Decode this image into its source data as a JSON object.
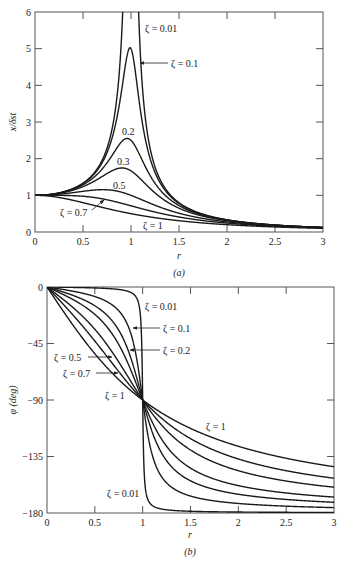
{
  "chart_data": [
    {
      "type": "line",
      "panel": "(a)",
      "title": "",
      "xlabel": "r",
      "ylabel": "x/δst",
      "xlim": [
        0,
        3
      ],
      "ylim": [
        0,
        6
      ],
      "xticks": [
        0,
        0.5,
        1,
        1.5,
        2,
        2.5,
        3
      ],
      "xtick_labels": [
        "0",
        "0.5",
        "1",
        "1.5",
        "2",
        "2.5",
        "3"
      ],
      "yticks": [
        0,
        1,
        2,
        3,
        4,
        5,
        6
      ],
      "ytick_labels": [
        "0",
        "1",
        "2",
        "3",
        "4",
        "5",
        "6"
      ],
      "grid": false,
      "legend": "none (inline annotations)",
      "formula": "x/δst = 1/sqrt((1-r^2)^2 + (2ζr)^2)",
      "series": [
        {
          "name": "ζ = 0.01",
          "zeta": 0.01,
          "peak_value": 50.0,
          "peak_r": 1.0
        },
        {
          "name": "ζ = 0.1",
          "zeta": 0.1,
          "peak_value": 5.03,
          "peak_r": 0.99
        },
        {
          "name": "0.2",
          "zeta": 0.2,
          "peak_value": 2.55,
          "peak_r": 0.96
        },
        {
          "name": "0.3",
          "zeta": 0.3,
          "peak_value": 1.75,
          "peak_r": 0.91
        },
        {
          "name": "0.5",
          "zeta": 0.5,
          "peak_value": 1.15,
          "peak_r": 0.71
        },
        {
          "name": "ζ = 0.7",
          "zeta": 0.7,
          "peak_value": 1.0,
          "peak_r": 0.0
        },
        {
          "name": "ζ = 1",
          "zeta": 1.0,
          "peak_value": 1.0,
          "peak_r": 0.0
        }
      ],
      "sample_points": {
        "r": [
          0,
          0.5,
          1,
          1.5,
          2,
          2.5,
          3
        ],
        "zeta_0.1": [
          1.0,
          1.32,
          5.0,
          0.78,
          0.33,
          0.19,
          0.12
        ],
        "zeta_0.5": [
          1.0,
          1.11,
          1.0,
          0.57,
          0.3,
          0.18,
          0.12
        ],
        "zeta_1": [
          1.0,
          0.8,
          0.5,
          0.31,
          0.2,
          0.14,
          0.1
        ]
      },
      "annotations": [
        "ζ = 0.01",
        "ζ = 0.1",
        "0.2",
        "0.3",
        "0.5",
        "ζ = 0.7",
        "ζ = 1"
      ]
    },
    {
      "type": "line",
      "panel": "(b)",
      "title": "",
      "xlabel": "r",
      "ylabel": "φ (deg)",
      "xlim": [
        0,
        3
      ],
      "ylim": [
        -180,
        0
      ],
      "xticks": [
        0,
        0.5,
        1,
        1.5,
        2,
        2.5,
        3
      ],
      "xtick_labels": [
        "0",
        "0.5",
        "1",
        "1.5",
        "2",
        "2.5",
        "3"
      ],
      "yticks": [
        0,
        -45,
        -90,
        -135,
        -180
      ],
      "ytick_labels": [
        "0",
        "−45",
        "−90",
        "−135",
        "−180"
      ],
      "grid": false,
      "legend": "none (inline annotations)",
      "formula": "φ = −atan2(2ζr, 1 − r^2)",
      "series": [
        {
          "name": "ζ = 0.01",
          "zeta": 0.01
        },
        {
          "name": "ζ = 0.1",
          "zeta": 0.1
        },
        {
          "name": "ζ = 0.2",
          "zeta": 0.2
        },
        {
          "name": "ζ = 0.3",
          "zeta": 0.3
        },
        {
          "name": "ζ = 0.5",
          "zeta": 0.5
        },
        {
          "name": "ζ = 0.7",
          "zeta": 0.7
        },
        {
          "name": "ζ = 1",
          "zeta": 1.0
        }
      ],
      "sample_points": {
        "r": [
          0,
          0.5,
          1,
          1.5,
          2,
          2.5,
          3
        ],
        "zeta_1": [
          0,
          -53.1,
          -90,
          -112.6,
          -126.9,
          -136.4,
          -143.1
        ],
        "zeta_0.1": [
          0,
          -7.6,
          -90,
          -166.5,
          -172.4,
          -174.6,
          -175.7
        ]
      },
      "annotations": [
        "ζ = 0.01",
        "ζ = 0.1",
        "ζ = 0.2",
        "ζ = 0.5",
        "ζ = 0.7",
        "ζ = 1",
        "ζ = 1",
        "ζ = 0.01"
      ]
    }
  ],
  "panel_a": {
    "caption": "(a)",
    "xlabel": "r",
    "ylabel": "x/δst",
    "labels": {
      "z001": "ζ = 0.01",
      "z01": "ζ = 0.1",
      "z02": "0.2",
      "z03": "0.3",
      "z05": "0.5",
      "z07": "ζ = 0.7",
      "z1": "ζ = 1"
    }
  },
  "panel_b": {
    "caption": "(b)",
    "xlabel": "r",
    "ylabel": "φ (deg)",
    "labels": {
      "z001_top": "ζ = 0.01",
      "z01": "ζ = 0.1",
      "z02": "ζ = 0.2",
      "z05": "ζ = 0.5",
      "z07": "ζ = 0.7",
      "z1_left": "ζ = 1",
      "z1_right": "ζ = 1",
      "z001_bottom": "ζ = 0.01"
    }
  }
}
